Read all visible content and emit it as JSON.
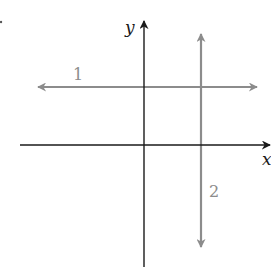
{
  "diagram": {
    "axes": {
      "x_label": "x",
      "y_label": "y",
      "color": "#1a1a1a"
    },
    "lines": [
      {
        "id": "1",
        "label": "1",
        "orientation": "horizontal",
        "color": "#8c8c8c"
      },
      {
        "id": "2",
        "label": "2",
        "orientation": "vertical",
        "color": "#8c8c8c"
      }
    ]
  }
}
